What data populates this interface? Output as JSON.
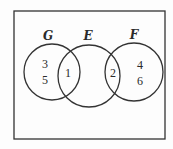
{
  "diagram": {
    "type": "venn",
    "universe": {
      "x": 14,
      "y": 11,
      "width": 151,
      "height": 128
    },
    "sets": [
      {
        "label": "G",
        "cx": 52,
        "cy": 72,
        "r": 28,
        "label_x": 48,
        "label_y": 40
      },
      {
        "label": "E",
        "cx": 89,
        "cy": 76,
        "r": 31,
        "label_x": 88,
        "label_y": 40
      },
      {
        "label": "F",
        "cx": 134,
        "cy": 72,
        "r": 29,
        "label_x": 134,
        "label_y": 39
      }
    ],
    "elements": [
      {
        "value": "3",
        "x": 45,
        "y": 68,
        "region": "G only"
      },
      {
        "value": "5",
        "x": 45,
        "y": 84,
        "region": "G only"
      },
      {
        "value": "1",
        "x": 68,
        "y": 77,
        "region": "G ∩ E"
      },
      {
        "value": "2",
        "x": 113,
        "y": 77,
        "region": "E ∩ F"
      },
      {
        "value": "4",
        "x": 140,
        "y": 69,
        "region": "F only"
      },
      {
        "value": "6",
        "x": 140,
        "y": 85,
        "region": "F only"
      }
    ],
    "colors": {
      "stroke": "#333333",
      "text": "#2a2a2a",
      "background": "#fdfdfd"
    }
  }
}
